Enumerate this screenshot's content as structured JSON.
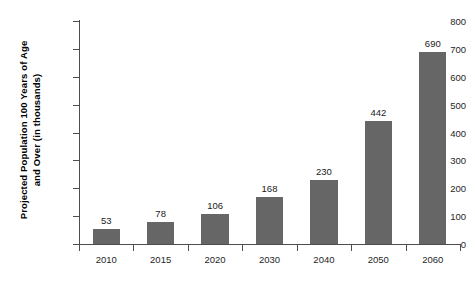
{
  "chart_data": {
    "type": "bar",
    "title": "",
    "xlabel": "",
    "ylabel": "Projected Population 100 Years of Age and Over (in thousands)",
    "ylabel_lines": [
      "Projected Population 100 Years of Age",
      "and Over (in thousands)"
    ],
    "categories": [
      "2010",
      "2015",
      "2020",
      "2030",
      "2040",
      "2050",
      "2060"
    ],
    "values": [
      53,
      78,
      106,
      168,
      230,
      442,
      690
    ],
    "data_labels": [
      "53",
      "78",
      "106",
      "168",
      "230",
      "442",
      "690"
    ],
    "ylim": [
      0,
      800
    ],
    "yticks": [
      0,
      100,
      200,
      300,
      400,
      500,
      600,
      700,
      800
    ],
    "ytick_labels": [
      "0",
      "100",
      "200",
      "300",
      "400",
      "500",
      "600",
      "700",
      "800"
    ],
    "grid": false,
    "legend": false,
    "bar_color": "#666666",
    "axis_color": "#4d4d4d",
    "text_color": "#262626"
  }
}
